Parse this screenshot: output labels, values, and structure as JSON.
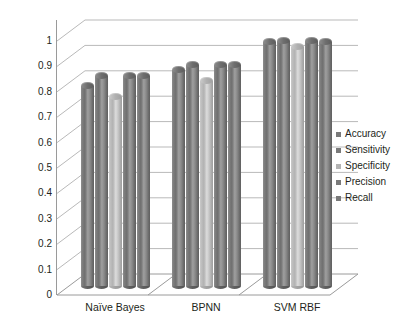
{
  "chart_data": {
    "type": "bar",
    "title": "",
    "subtitle": "",
    "xlabel": "",
    "ylabel": "",
    "categories": [
      "Naïve Bayes",
      "BPNN",
      "SVM RBF"
    ],
    "series": [
      {
        "name": "Accuracy",
        "values": [
          0.8,
          0.865,
          0.975
        ]
      },
      {
        "name": "Sensitivity",
        "values": [
          0.84,
          0.885,
          0.98
        ]
      },
      {
        "name": "Specificity",
        "values": [
          0.76,
          0.82,
          0.955
        ]
      },
      {
        "name": "Precision",
        "values": [
          0.84,
          0.885,
          0.98
        ]
      },
      {
        "name": "Recall",
        "values": [
          0.84,
          0.885,
          0.975
        ]
      }
    ],
    "ylim": [
      0,
      1
    ],
    "ytick_labels": [
      "1",
      "0.9",
      "0.8",
      "0.7",
      "0.6",
      "0.5",
      "0.4",
      "0.3",
      "0.2",
      "0.1",
      "0"
    ],
    "ytick_values": [
      1,
      0.9,
      0.8,
      0.7,
      0.6,
      0.5,
      0.4,
      0.3,
      0.2,
      0.1,
      0
    ],
    "grid": true,
    "grid_axis": "y",
    "legend_position": "right",
    "style": "3d-cylinder",
    "colors": {
      "bar_default": "#7a7a7a",
      "bar_light": "#b4b4b4",
      "grid": "#b9b9b9",
      "axis": "#9a9a9a",
      "text": "#231f20",
      "background": "#ffffff"
    },
    "light_series_index": 2
  },
  "legend": {
    "items": [
      {
        "label": "Accuracy"
      },
      {
        "label": "Sensitivity"
      },
      {
        "label": "Specificity"
      },
      {
        "label": "Precision"
      },
      {
        "label": "Recall"
      }
    ]
  }
}
